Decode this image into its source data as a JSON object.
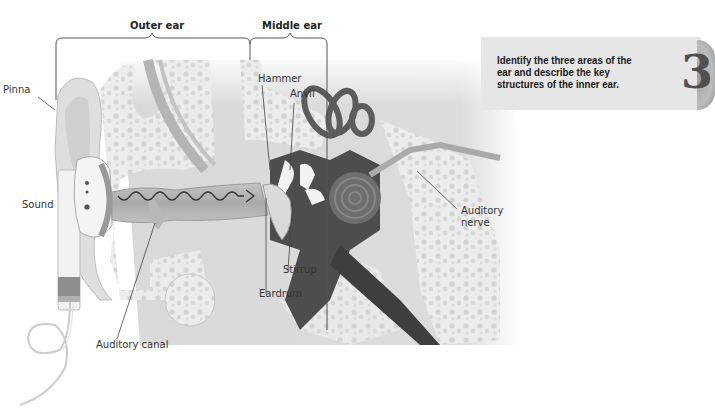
{
  "diagram": {
    "regions": [
      {
        "id": "outer",
        "label": "Outer ear"
      },
      {
        "id": "middle",
        "label": "Middle ear"
      }
    ],
    "labels": {
      "pinna": "Pinna",
      "sound": "Sound",
      "hammer": "Hammer",
      "anvil": "Anvil",
      "auditory_nerve_1": "Auditory",
      "auditory_nerve_2": "nerve",
      "stirrup": "Stirrup",
      "eardrum": "Eardrum",
      "auditory_canal": "Auditory canal"
    }
  },
  "objective": {
    "text": "Identify the three areas of the ear and describe the key structures of the inner ear.",
    "number": "3"
  },
  "colors": {
    "tissue_light": "#e4e4e4",
    "tissue_mid": "#c8c8c8",
    "cavity_dark": "#4a4a4a",
    "panel_bg": "#e6e6e6"
  }
}
